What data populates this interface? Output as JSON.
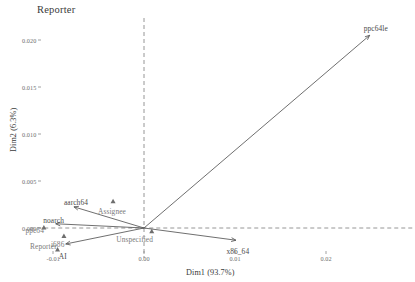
{
  "chart_data": {
    "type": "scatter",
    "title": "Reporter",
    "xlabel": "Dim1 (93.7%)",
    "ylabel": "Dim2 (6.3%)",
    "xlim": [
      -0.0125,
      0.0265
    ],
    "ylim": [
      -0.0031,
      0.0222
    ],
    "xticks": [
      -0.01,
      0.0,
      0.01,
      0.02
    ],
    "xticklabels": [
      "-0.01",
      "0.00",
      "0.01",
      "0.02"
    ],
    "yticks": [
      0.0,
      0.005,
      0.01,
      0.015,
      0.02
    ],
    "yticklabels": [
      "0.000",
      "0.005",
      "0.010",
      "0.015",
      "0.020"
    ],
    "grid": false,
    "legend": "none",
    "origin_lines": {
      "style": "dashed",
      "x": 0.0,
      "y": 0.0
    },
    "arrows": [
      {
        "label": "ppc64le",
        "x": 0.0248,
        "y": 0.0205,
        "label_dx": 6,
        "label_dy": -7
      },
      {
        "label": "x86_64",
        "x": 0.0101,
        "y": -0.0013,
        "label_dx": 2,
        "label_dy": 11
      },
      {
        "label": "AI",
        "x": -0.0086,
        "y": -0.0017,
        "label_dx": -3,
        "label_dy": 13
      },
      {
        "label": "noarch",
        "x": -0.0097,
        "y": 0.00045,
        "label_dx": -2,
        "label_dy": -3
      },
      {
        "label": "aarch64",
        "x": -0.0077,
        "y": 0.00225,
        "label_dx": 2,
        "label_dy": -4
      }
    ],
    "points": [
      {
        "label": "Assignee",
        "x": -0.0034,
        "y": 0.00285,
        "marker": "triangle",
        "label_dx": -1,
        "label_dy": 10
      },
      {
        "label": "Unspecified",
        "x": 0.00085,
        "y": -0.00035,
        "marker": "triangle",
        "label_dx": -17,
        "label_dy": 8
      },
      {
        "label": "i686",
        "x": -0.0088,
        "y": -0.00085,
        "marker": "triangle",
        "label_dx": -6,
        "label_dy": 9
      },
      {
        "label": "ppc64",
        "x": -0.011,
        "y": 5e-05,
        "marker": "triangle",
        "label_dx": -9,
        "label_dy": 3
      },
      {
        "label": "Reporter",
        "x": -0.0095,
        "y": -0.0023,
        "marker": "triangle",
        "label_dx": -14,
        "label_dy": -3
      }
    ],
    "colors": {
      "arrow": "#555555",
      "point": "#6e6e6e",
      "dashline": "#8a8a8a",
      "tick_text": "#6e6e6e",
      "axis_text": "#3a3a3a",
      "cat_text": "#7b7b7b"
    }
  }
}
